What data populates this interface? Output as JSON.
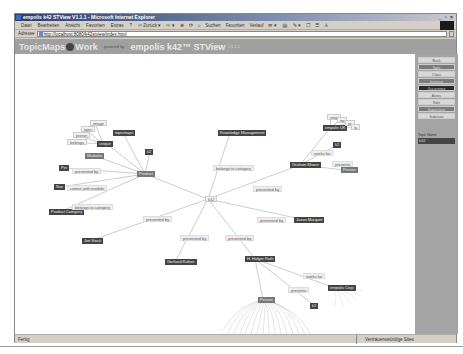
{
  "window": {
    "title": "empolis k42 STView V1.1.1 - Microsoft Internet Explorer",
    "controls": "_ ▫ ×"
  },
  "menubar": {
    "items": [
      "Datei",
      "Bearbeiten",
      "Ansicht",
      "Favoriten",
      "Extras",
      "?"
    ],
    "tools": [
      "⇦ Zurück ▾",
      "⇨ ▾",
      "⊗",
      "⟳",
      "⌂",
      "Suchen",
      "Favoriten",
      "Verlauf",
      "✉ ▾",
      "🖨",
      "✎ ▾",
      "☐",
      "☰",
      "♙"
    ]
  },
  "addressbar": {
    "label": "Adresse",
    "url": "http://localhost:8080/k42stview/index.html"
  },
  "header": {
    "brand_left": "TopicMaps",
    "brand_right": "Work",
    "powered": "powered by",
    "product": "empolis k42™ STView",
    "version": "V1.1.1"
  },
  "sidebar": {
    "buttons": [
      {
        "label": "Back",
        "style": "light"
      },
      {
        "label": "Topic",
        "style": "mid"
      },
      {
        "label": "Class",
        "style": "light"
      },
      {
        "label": "Instance",
        "style": "mid"
      },
      {
        "label": "Occurrence",
        "style": "dark"
      },
      {
        "label": "Assoc",
        "style": "light"
      },
      {
        "label": "Role",
        "style": "light"
      },
      {
        "label": "Superclass",
        "style": "mid"
      },
      {
        "label": "Subclass",
        "style": "light"
      }
    ],
    "topic_name_label": "Topic Name",
    "topic_name_value": "k42"
  },
  "graph": {
    "center": "k42",
    "nodes": [
      {
        "id": "k42",
        "text": "k42",
        "x": 190,
        "y": 142,
        "style": "tag"
      },
      {
        "id": "product",
        "text": "Product",
        "x": 122,
        "y": 117,
        "style": "mid"
      },
      {
        "id": "km",
        "text": "Knowledge Management",
        "x": 203,
        "y": 76,
        "style": "dark"
      },
      {
        "id": "graham",
        "text": "Graham Moore",
        "x": 275,
        "y": 108,
        "style": "dark"
      },
      {
        "id": "empolisuk",
        "text": "empolis UK",
        "x": 308,
        "y": 71,
        "style": "dark"
      },
      {
        "id": "jason",
        "text": "Jason Marquet",
        "x": 279,
        "y": 163,
        "style": "dark"
      },
      {
        "id": "jim",
        "text": "Jim Stock",
        "x": 67,
        "y": 184,
        "style": "dark"
      },
      {
        "id": "gerhard",
        "text": "Gerhard Kofner",
        "x": 150,
        "y": 205,
        "style": "dark"
      },
      {
        "id": "holger",
        "text": "H. Holger Rath",
        "x": 230,
        "y": 202,
        "style": "dark"
      },
      {
        "id": "person",
        "text": "Person",
        "x": 243,
        "y": 243,
        "style": "mid"
      },
      {
        "id": "empoliscorp",
        "text": "empolis Corp",
        "x": 313,
        "y": 231,
        "style": "dark"
      },
      {
        "id": "k2a",
        "text": "k2",
        "x": 295,
        "y": 249,
        "style": "dark"
      },
      {
        "id": "k2b",
        "text": "k2",
        "x": 130,
        "y": 95,
        "style": "dark"
      },
      {
        "id": "k2c",
        "text": "k2",
        "x": 318,
        "y": 88,
        "style": "dark"
      },
      {
        "id": "person2",
        "text": "Person",
        "x": 326,
        "y": 113,
        "style": "mid"
      },
      {
        "id": "topicmaps",
        "text": "topicmaps",
        "x": 98,
        "y": 76,
        "style": "dark"
      },
      {
        "id": "unique",
        "text": "unique",
        "x": 82,
        "y": 87,
        "style": "dark"
      },
      {
        "id": "modules",
        "text": "Modules",
        "x": 70,
        "y": 99,
        "style": "mid"
      },
      {
        "id": "per",
        "text": "Per",
        "x": 44,
        "y": 111,
        "style": "dark"
      },
      {
        "id": "nav",
        "text": "Nav",
        "x": 39,
        "y": 130,
        "style": "dark"
      },
      {
        "id": "prodcat",
        "text": "Product Category",
        "x": 34,
        "y": 155,
        "style": "dark"
      },
      {
        "id": "image",
        "text": "image",
        "x": 75,
        "y": 66,
        "style": "tag"
      },
      {
        "id": "topic",
        "text": "topic",
        "x": 66,
        "y": 72,
        "style": "tag"
      },
      {
        "id": "preser",
        "text": "preser",
        "x": 58,
        "y": 78,
        "style": "tag"
      },
      {
        "id": "belongs",
        "text": "belongs",
        "x": 52,
        "y": 85,
        "style": "tag"
      },
      {
        "id": "empsm1",
        "text": "emp",
        "x": 312,
        "y": 60,
        "style": "tag"
      },
      {
        "id": "empsm2",
        "text": "ep",
        "x": 322,
        "y": 63,
        "style": "tag"
      },
      {
        "id": "empsm3",
        "text": "pr",
        "x": 330,
        "y": 66,
        "style": "tag"
      },
      {
        "id": "empsm4",
        "text": "ta",
        "x": 336,
        "y": 70,
        "style": "tag"
      }
    ],
    "edge_labels": [
      {
        "text": "belongs to category",
        "x": 198,
        "y": 111
      },
      {
        "text": "presented by",
        "x": 238,
        "y": 132
      },
      {
        "text": "works for",
        "x": 296,
        "y": 96
      },
      {
        "text": "presents",
        "x": 317,
        "y": 107
      },
      {
        "text": "presented by",
        "x": 242,
        "y": 163
      },
      {
        "text": "presented by",
        "x": 128,
        "y": 162
      },
      {
        "text": "presented by",
        "x": 165,
        "y": 181
      },
      {
        "text": "presented by",
        "x": 210,
        "y": 181
      },
      {
        "text": "works for",
        "x": 288,
        "y": 219
      },
      {
        "text": "presents",
        "x": 273,
        "y": 233
      },
      {
        "text": "presented by",
        "x": 57,
        "y": 114
      },
      {
        "text": "comes with module",
        "x": 52,
        "y": 131
      },
      {
        "text": "belongs to category",
        "x": 57,
        "y": 150
      }
    ]
  },
  "statusbar": {
    "left": "Fertig",
    "zone": "Vertrauenswürdige Sites"
  }
}
